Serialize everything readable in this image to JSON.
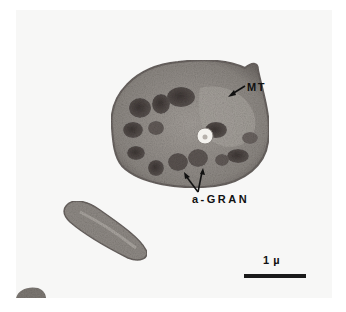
{
  "figure": {
    "labels": {
      "microtubules": "MT",
      "alpha_granules": "a-GRAN",
      "scale_bar": "1 µ"
    },
    "colors": {
      "background": "#f7f7f6",
      "cytoplasm": "#8a8580",
      "granule": "#4a4442",
      "label_text": "#111111"
    }
  }
}
